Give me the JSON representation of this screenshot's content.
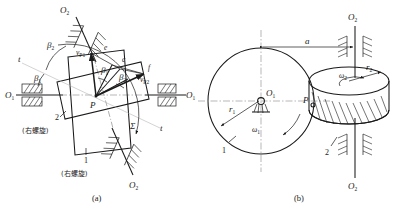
{
  "figure": {
    "captions": {
      "a": "(a)",
      "b": "(b)"
    }
  },
  "panel_a": {
    "name": "velocity and helix-angle relations at pitch point",
    "labels": {
      "axis_o1_left": "O",
      "axis_o1_left_sub": "1",
      "axis_o1_right": "O",
      "axis_o1_right_sub": "1",
      "axis_o2_top": "O",
      "axis_o2_top_sub": "2",
      "axis_o2_bottom": "O",
      "axis_o2_bottom_sub": "2",
      "tangent_left": "t",
      "tangent_right": "t",
      "beta1_lower": "β",
      "beta1_lower_sub": "1",
      "beta2_upper": "β",
      "beta2_upper_sub": "2",
      "beta1_center": "β",
      "beta1_center_sub": "1",
      "beta2_center": "β",
      "beta2_center_sub": "2",
      "v_p1": "v",
      "v_p1_sub": "P1",
      "v_p2": "v",
      "v_p2_sub": "P2",
      "point_e": "e",
      "point_c": "c",
      "point_f": "f",
      "pitch_point": "P",
      "sigma": "Σ",
      "gear1_num": "1",
      "gear1_hand": "(右螺旋)",
      "gear2_num": "2",
      "gear2_hand": "(右螺旋)"
    }
  },
  "panel_b": {
    "name": "spatial arrangement of the two crossed helical gears",
    "labels": {
      "axis_o1": "O",
      "axis_o1_sub": "1",
      "axis_o2_top": "O",
      "axis_o2_top_sub": "2",
      "axis_o2_bottom": "O",
      "axis_o2_bottom_sub": "2",
      "radius1": "r",
      "radius1_sub": "1",
      "radius2": "r",
      "radius2_sub": "2",
      "omega1": "ω",
      "omega1_sub": "1",
      "omega2": "ω",
      "omega2_sub": "2",
      "center_distance": "a",
      "pitch_point": "P",
      "gear1_num": "1",
      "gear2_num": "2"
    }
  },
  "colors": {
    "ink": "#1a1a1a",
    "centerline": "#9a9a9a",
    "background": "#ffffff"
  }
}
